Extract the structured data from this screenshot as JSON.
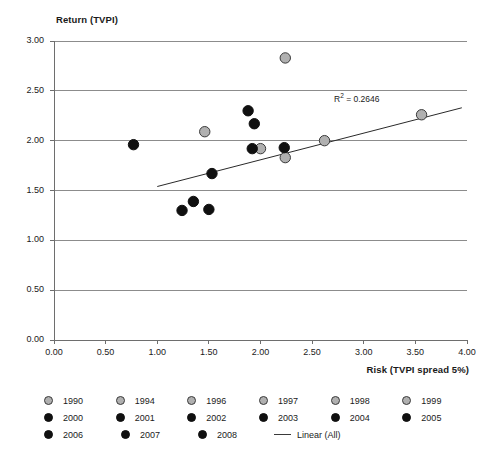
{
  "chart_data": {
    "type": "scatter",
    "title": "",
    "xlabel": "Risk (TVPI spread 5%)",
    "ylabel": "Return (TVPI)",
    "xlim": [
      0.0,
      4.0
    ],
    "ylim": [
      0.0,
      3.0
    ],
    "xticks": [
      "0.00",
      "0.50",
      "1.00",
      "1.50",
      "2.00",
      "2.50",
      "3.00",
      "3.50",
      "4.00"
    ],
    "yticks": [
      "0.00",
      "0.50",
      "1.00",
      "1.50",
      "2.00",
      "2.50",
      "3.00"
    ],
    "grid": "horizontal",
    "legend_position": "bottom",
    "annotation": "R² = 0.2646",
    "r_squared": 0.2646,
    "points": [
      {
        "year": "1990",
        "color": "gray",
        "x": 2.62,
        "y": 2.0
      },
      {
        "year": "1994",
        "color": "gray",
        "x": 2.0,
        "y": 1.92
      },
      {
        "year": "1996",
        "color": "gray",
        "x": 1.46,
        "y": 2.09
      },
      {
        "year": "1997",
        "color": "gray",
        "x": 2.24,
        "y": 2.83
      },
      {
        "year": "1998",
        "color": "gray",
        "x": 2.24,
        "y": 1.83
      },
      {
        "year": "1999",
        "color": "gray",
        "x": 3.56,
        "y": 2.26
      },
      {
        "year": "2000",
        "color": "black",
        "x": 0.77,
        "y": 1.96
      },
      {
        "year": "2001",
        "color": "black",
        "x": 1.88,
        "y": 2.3
      },
      {
        "year": "2002",
        "color": "black",
        "x": 1.94,
        "y": 2.17
      },
      {
        "year": "2003",
        "color": "black",
        "x": 2.23,
        "y": 1.93
      },
      {
        "year": "2004",
        "color": "black",
        "x": 1.53,
        "y": 1.67
      },
      {
        "year": "2005",
        "color": "black",
        "x": 1.24,
        "y": 1.3
      },
      {
        "year": "2006",
        "color": "black",
        "x": 1.35,
        "y": 1.39
      },
      {
        "year": "2007",
        "color": "black",
        "x": 1.5,
        "y": 1.31
      },
      {
        "year": "2008",
        "color": "black",
        "x": 1.92,
        "y": 1.92
      }
    ],
    "trendline": {
      "label": "Linear (All)",
      "x_start": 1.0,
      "y_start": 1.54,
      "x_end": 3.95,
      "y_end": 2.33
    },
    "legend": {
      "rows": [
        [
          {
            "label": "1990",
            "marker": "gray"
          },
          {
            "label": "1994",
            "marker": "gray"
          },
          {
            "label": "1996",
            "marker": "gray"
          },
          {
            "label": "1997",
            "marker": "gray"
          },
          {
            "label": "1998",
            "marker": "gray"
          },
          {
            "label": "1999",
            "marker": "gray"
          }
        ],
        [
          {
            "label": "2000",
            "marker": "black"
          },
          {
            "label": "2001",
            "marker": "black"
          },
          {
            "label": "2002",
            "marker": "black"
          },
          {
            "label": "2003",
            "marker": "black"
          },
          {
            "label": "2004",
            "marker": "black"
          },
          {
            "label": "2005",
            "marker": "black"
          }
        ],
        [
          {
            "label": "2006",
            "marker": "black"
          },
          {
            "label": "2007",
            "marker": "black"
          },
          {
            "label": "2008",
            "marker": "black"
          },
          {
            "label": "Linear (All)",
            "marker": "line"
          }
        ]
      ]
    },
    "colors": {
      "marker_gray": "#b0b0b0",
      "marker_black": "#101010",
      "marker_edge": "#3a3a3a",
      "gridline": "#8c8c8c",
      "axis": "#6e6e6e",
      "trendline": "#2a2a2a",
      "text": "#1a1a1a",
      "background": "#ffffff"
    }
  }
}
